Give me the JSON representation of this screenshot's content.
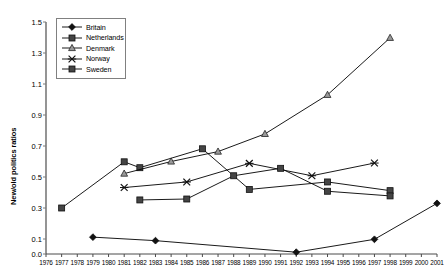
{
  "chart_data": {
    "type": "line",
    "title": "",
    "xlabel": "",
    "ylabel": "New/old politics ratios",
    "x": [
      1976,
      1977,
      1978,
      1979,
      1980,
      1981,
      1982,
      1983,
      1984,
      1985,
      1986,
      1987,
      1988,
      1989,
      1990,
      1991,
      1992,
      1993,
      1994,
      1995,
      1996,
      1997,
      1998,
      1999,
      2000,
      2001
    ],
    "xlim": [
      1976,
      2001
    ],
    "ylim": [
      0.0,
      1.5
    ],
    "yticks": [
      0.0,
      0.1,
      0.3,
      0.5,
      0.7,
      0.9,
      1.1,
      1.3,
      1.5
    ],
    "ytick_labels": [
      "0.0",
      "0.1",
      "0.3",
      "0.5",
      "0.7",
      "0.9",
      "1.1",
      "1.3",
      "1.5"
    ],
    "grid": false,
    "legend_position": "top-left",
    "series": [
      {
        "name": "Britain",
        "marker": "diamond",
        "color": "#000000",
        "points": [
          {
            "x": 1979,
            "y": 0.112
          },
          {
            "x": 1983,
            "y": 0.089
          },
          {
            "x": 1992,
            "y": 0.012
          },
          {
            "x": 1997,
            "y": 0.098
          },
          {
            "x": 2001,
            "y": 0.33
          }
        ]
      },
      {
        "name": "Netherlands",
        "marker": "square",
        "color": "#000000",
        "points": [
          {
            "x": 1977,
            "y": 0.3
          },
          {
            "x": 1981,
            "y": 0.598
          },
          {
            "x": 1982,
            "y": 0.56
          },
          {
            "x": 1986,
            "y": 0.682
          },
          {
            "x": 1989,
            "y": 0.42
          },
          {
            "x": 1994,
            "y": 0.468
          },
          {
            "x": 1998,
            "y": 0.412
          }
        ]
      },
      {
        "name": "Denmark",
        "marker": "triangle",
        "color": "#000000",
        "points": [
          {
            "x": 1981,
            "y": 0.522
          },
          {
            "x": 1984,
            "y": 0.6
          },
          {
            "x": 1987,
            "y": 0.664
          },
          {
            "x": 1990,
            "y": 0.778
          },
          {
            "x": 1994,
            "y": 1.03
          },
          {
            "x": 1998,
            "y": 1.398
          }
        ]
      },
      {
        "name": "Norway",
        "marker": "cross",
        "color": "#000000",
        "points": [
          {
            "x": 1981,
            "y": 0.432
          },
          {
            "x": 1985,
            "y": 0.468
          },
          {
            "x": 1989,
            "y": 0.588
          },
          {
            "x": 1993,
            "y": 0.508
          },
          {
            "x": 1997,
            "y": 0.59
          }
        ]
      },
      {
        "name": "Sweden",
        "marker": "square",
        "color": "#000000",
        "points": [
          {
            "x": 1982,
            "y": 0.352
          },
          {
            "x": 1985,
            "y": 0.358
          },
          {
            "x": 1988,
            "y": 0.508
          },
          {
            "x": 1991,
            "y": 0.556
          },
          {
            "x": 1994,
            "y": 0.408
          },
          {
            "x": 1998,
            "y": 0.378
          }
        ]
      }
    ],
    "legend": [
      "Britain",
      "Netherlands",
      "Denmark",
      "Norway",
      "Sweden"
    ]
  }
}
